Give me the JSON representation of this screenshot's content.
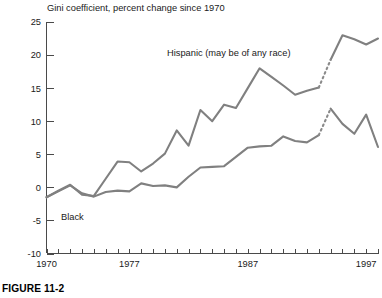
{
  "figure": {
    "caption": "FIGURE 11-2"
  },
  "chart_data": {
    "type": "line",
    "title": "Gini coefficient, percent change since 1970",
    "xlabel": "",
    "ylabel": "",
    "xlim": [
      1970,
      1998
    ],
    "ylim": [
      -10,
      25
    ],
    "yticks": [
      -10,
      -5,
      0,
      5,
      10,
      15,
      20,
      25
    ],
    "ytick_labels": [
      "-10",
      "-5",
      "0",
      "5",
      "10",
      "15",
      "20",
      "25"
    ],
    "xticks": [
      1970,
      1971,
      1972,
      1973,
      1974,
      1975,
      1976,
      1977,
      1978,
      1979,
      1980,
      1981,
      1982,
      1983,
      1984,
      1985,
      1986,
      1987,
      1988,
      1989,
      1990,
      1991,
      1992,
      1993,
      1994,
      1995,
      1996,
      1997,
      1998
    ],
    "xtick_labels_shown": [
      {
        "x": 1970,
        "label": "1970"
      },
      {
        "x": 1977,
        "label": "1977"
      },
      {
        "x": 1987,
        "label": "1987"
      },
      {
        "x": 1997,
        "label": "1997"
      }
    ],
    "grid": false,
    "legend_position": "inline-annotations",
    "annotations": [
      {
        "text": "Hispanic (may be of any race)",
        "x": 1983.6,
        "y": 20.6
      },
      {
        "text": "Black",
        "x": 1973.1,
        "y": -3.4
      }
    ],
    "series": [
      {
        "name": "Hispanic (may be of any race)",
        "color": "#808080",
        "break_dashed_between": [
          1993,
          1994
        ],
        "x": [
          1970,
          1971,
          1972,
          1973,
          1974,
          1975,
          1976,
          1977,
          1978,
          1979,
          1980,
          1981,
          1982,
          1983,
          1984,
          1985,
          1986,
          1987,
          1988,
          1989,
          1990,
          1991,
          1992,
          1993,
          1994,
          1995,
          1996,
          1997,
          1998
        ],
        "values": [
          -1.5,
          -0.5,
          0.4,
          -1.1,
          -1.3,
          1.3,
          3.9,
          3.8,
          2.4,
          3.6,
          5.1,
          8.6,
          6.3,
          11.7,
          10.0,
          12.5,
          12.0,
          15.0,
          18.0,
          16.7,
          15.4,
          14.0,
          14.6,
          15.1,
          19.3,
          23.0,
          22.4,
          21.6,
          22.5
        ]
      },
      {
        "name": "Black",
        "color": "#808080",
        "break_dashed_between": [
          1993,
          1994
        ],
        "x": [
          1970,
          1971,
          1972,
          1973,
          1974,
          1975,
          1976,
          1977,
          1978,
          1979,
          1980,
          1981,
          1982,
          1983,
          1984,
          1985,
          1986,
          1987,
          1988,
          1989,
          1990,
          1991,
          1992,
          1993,
          1994,
          1995,
          1996,
          1997,
          1998
        ],
        "values": [
          -1.5,
          -0.6,
          0.3,
          -0.9,
          -1.4,
          -0.7,
          -0.5,
          -0.6,
          0.6,
          0.2,
          0.3,
          0.0,
          1.6,
          3.0,
          3.1,
          3.2,
          4.6,
          6.0,
          6.2,
          6.3,
          7.7,
          7.0,
          6.8,
          7.9,
          11.9,
          9.6,
          8.1,
          11.0,
          6.1
        ]
      }
    ]
  }
}
